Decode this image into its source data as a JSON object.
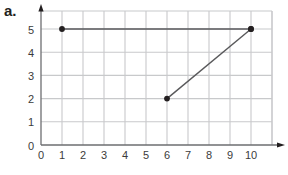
{
  "panel": {
    "label": "a."
  },
  "chart_data": {
    "type": "line",
    "title": "",
    "xlabel": "",
    "ylabel": "",
    "xlim": [
      0,
      11
    ],
    "ylim": [
      0,
      6
    ],
    "grid": true,
    "legend": "none",
    "x_ticks": [
      "0",
      "1",
      "2",
      "3",
      "4",
      "5",
      "6",
      "7",
      "8",
      "9",
      "10"
    ],
    "x_tick_values": [
      0,
      1,
      2,
      3,
      4,
      5,
      6,
      7,
      8,
      9,
      10
    ],
    "y_ticks": [
      "0",
      "1",
      "2",
      "3",
      "4",
      "5"
    ],
    "y_tick_values": [
      0,
      1,
      2,
      3,
      4,
      5
    ],
    "series": [
      {
        "name": "segment-1",
        "points": [
          [
            1,
            5
          ],
          [
            10,
            5
          ]
        ],
        "markers": [
          [
            1,
            5
          ],
          [
            10,
            5
          ]
        ],
        "color": "#59595b"
      },
      {
        "name": "segment-2",
        "points": [
          [
            6,
            2
          ],
          [
            10,
            5
          ]
        ],
        "markers": [
          [
            6,
            2
          ],
          [
            10,
            5
          ]
        ],
        "color": "#59595b"
      }
    ],
    "colors": {
      "grid": "#c8c9cb",
      "axis": "#6d6e71",
      "marker": "#231f20",
      "line": "#59595b",
      "tick_text": "#3b3b3b"
    }
  }
}
